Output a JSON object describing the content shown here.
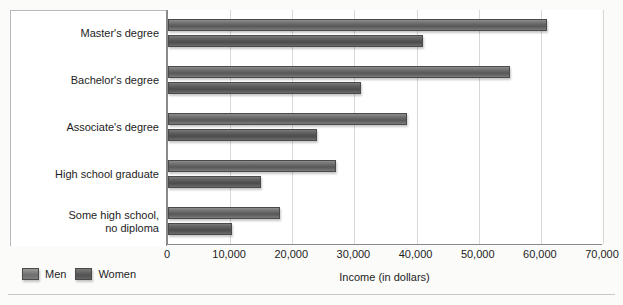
{
  "chart_data": {
    "type": "bar",
    "orientation": "horizontal",
    "title": "",
    "xlabel": "Income (in dollars)",
    "ylabel": "",
    "xlim": [
      0,
      70000
    ],
    "xticks": [
      "0",
      "10,000",
      "20,000",
      "30,000",
      "40,000",
      "50,000",
      "60,000",
      "70,000"
    ],
    "xtick_values": [
      0,
      10000,
      20000,
      30000,
      40000,
      50000,
      60000,
      70000
    ],
    "grid": "vertical",
    "legend_position": "bottom-left",
    "categories": [
      "Master's degree",
      "Bachelor's degree",
      "Associate's degree",
      "High school graduate",
      "Some high school,\nno diploma"
    ],
    "series": [
      {
        "name": "Men",
        "values": [
          61000,
          55000,
          38500,
          27000,
          18000
        ]
      },
      {
        "name": "Women",
        "values": [
          41000,
          31000,
          24000,
          15000,
          10300
        ]
      }
    ]
  },
  "legend": {
    "items": [
      {
        "label": "Men"
      },
      {
        "label": "Women"
      }
    ]
  },
  "axis": {
    "x_title": "Income (in dollars)"
  }
}
